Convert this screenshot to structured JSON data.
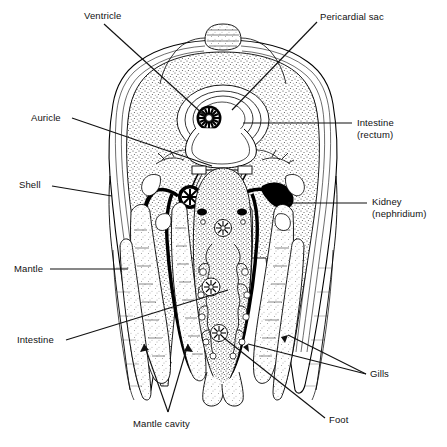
{
  "figure": {
    "style": "black and white stippled line drawing",
    "colors": {
      "background": "#ffffff",
      "ink": "#000000",
      "stipple": "#555555",
      "leader": "#111111"
    }
  },
  "labels": [
    {
      "id": "ventricle",
      "text": "Ventricle",
      "line2": "",
      "x": 84,
      "y": 10,
      "align": "left"
    },
    {
      "id": "pericardial",
      "text": "Pericardial sac",
      "line2": "",
      "x": 320,
      "y": 11,
      "align": "left"
    },
    {
      "id": "auricle",
      "text": "Auricle",
      "line2": "",
      "x": 31,
      "y": 112,
      "align": "left"
    },
    {
      "id": "intestine-rectum",
      "text": "Intestine",
      "line2": "(rectum)",
      "x": 357,
      "y": 117,
      "align": "left"
    },
    {
      "id": "shell",
      "text": "Shell",
      "line2": "",
      "x": 19,
      "y": 179,
      "align": "left"
    },
    {
      "id": "kidney",
      "text": "Kidney",
      "line2": "(nephridium)",
      "x": 372,
      "y": 196,
      "align": "left"
    },
    {
      "id": "mantle",
      "text": "Mantle",
      "line2": "",
      "x": 14,
      "y": 263,
      "align": "left"
    },
    {
      "id": "intestine",
      "text": "Intestine",
      "line2": "",
      "x": 17,
      "y": 334,
      "align": "left"
    },
    {
      "id": "gills",
      "text": "Gills",
      "line2": "",
      "x": 370,
      "y": 368,
      "align": "left"
    },
    {
      "id": "foot",
      "text": "Foot",
      "line2": "",
      "x": 329,
      "y": 414,
      "align": "left"
    },
    {
      "id": "mantle-cavity",
      "text": "Mantle cavity",
      "line2": "",
      "x": 133,
      "y": 418,
      "align": "left"
    }
  ],
  "structures": [
    {
      "id": "shell-valve",
      "name": "Shell valve (layered)"
    },
    {
      "id": "mantle-fold",
      "name": "Mantle fold"
    },
    {
      "id": "pericardial-sac",
      "name": "Pericardial sac"
    },
    {
      "id": "ventricle-rosette",
      "name": "Ventricle",
      "cx": 208,
      "cy": 118,
      "r": 11
    },
    {
      "id": "auricle-left",
      "name": "Left auricle"
    },
    {
      "id": "auricle-right",
      "name": "Right auricle"
    },
    {
      "id": "kidney-left",
      "name": "Left kidney (nephridium)",
      "cx": 190,
      "cy": 196,
      "r": 11
    },
    {
      "id": "kidney-right",
      "name": "Right kidney (nephridium)",
      "cx": 226,
      "cy": 196,
      "r": 11
    },
    {
      "id": "gill-outer-left",
      "name": "Outer left gill lamella"
    },
    {
      "id": "gill-inner-left",
      "name": "Inner left gill lamella"
    },
    {
      "id": "gill-inner-right",
      "name": "Inner right gill lamella"
    },
    {
      "id": "gill-outer-right",
      "name": "Outer right gill lamella"
    },
    {
      "id": "visceral-mass",
      "name": "Visceral mass / gonad with digestive branches"
    },
    {
      "id": "foot-mass",
      "name": "Foot"
    },
    {
      "id": "intestine-loop",
      "name": "Intestine loop"
    },
    {
      "id": "mantle-cavity-space",
      "name": "Mantle cavity"
    }
  ]
}
